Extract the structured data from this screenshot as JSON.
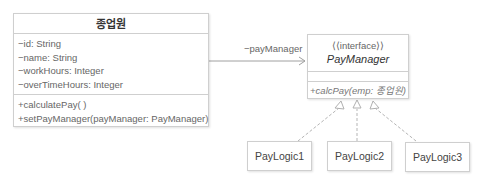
{
  "employee_class": {
    "name": "종업원",
    "attributes": [
      "−id: String",
      "−name: String",
      "−workHours: Integer",
      "−overTimeHours: Integer"
    ],
    "operations": [
      "+calculatePay( )",
      "+setPayManager(payManager: PayManager)"
    ]
  },
  "association": {
    "label": "−payManager"
  },
  "interface": {
    "stereotype": "⟨⟨interface⟩⟩",
    "name": "PayManager",
    "operations": [
      "+calcPay(emp: 종업원)"
    ]
  },
  "implementations": [
    {
      "name": "PayLogic1"
    },
    {
      "name": "PayLogic2"
    },
    {
      "name": "PayLogic3"
    }
  ],
  "colors": {
    "border": "#cfcfcf",
    "line": "#9a9a9a",
    "text": "#555555"
  }
}
